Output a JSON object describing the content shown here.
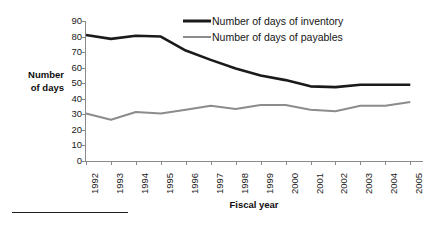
{
  "chart_data": {
    "type": "line",
    "title": "",
    "xlabel": "Fiscal year",
    "ylabel": "Number of days",
    "ylabel_line1": "Number",
    "ylabel_line2": "of days",
    "categories": [
      "1992",
      "1993",
      "1994",
      "1995",
      "1996",
      "1997",
      "1998",
      "1999",
      "2000",
      "2001",
      "2002",
      "2003",
      "2004",
      "2005"
    ],
    "ylim": [
      0,
      90
    ],
    "yticks": [
      90,
      80,
      70,
      60,
      50,
      40,
      30,
      20,
      10,
      0
    ],
    "grid": false,
    "legend_position": "top-right",
    "series": [
      {
        "name": "Number of days of inventory",
        "color": "#1a1a1a",
        "width": 2.6,
        "values": [
          81,
          78.5,
          80.5,
          80,
          71,
          65,
          59.5,
          55,
          52,
          48,
          47.5,
          49,
          49,
          49
        ]
      },
      {
        "name": "Number of days of payables",
        "color": "#8c8c8c",
        "width": 2.0,
        "values": [
          30.5,
          26.5,
          31.5,
          30.5,
          33,
          35.5,
          33.5,
          36,
          36,
          33,
          32,
          35.5,
          35.5,
          38
        ]
      }
    ]
  },
  "legend": {
    "items": [
      {
        "label": "Number of days of inventory",
        "color": "#1a1a1a",
        "thickness": "3px"
      },
      {
        "label": "Number of days of payables",
        "color": "#8c8c8c",
        "thickness": "2px"
      }
    ]
  },
  "colors": {
    "inventory": "#1a1a1a",
    "payables": "#8c8c8c",
    "axis": "#8a8a8a",
    "text": "#1a1a1a",
    "background": "#ffffff"
  }
}
